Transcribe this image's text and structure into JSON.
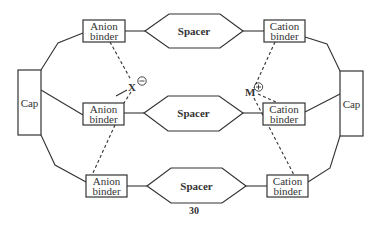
{
  "figure": {
    "number": "30",
    "caps": [
      {
        "id": "left",
        "label": "Cap"
      },
      {
        "id": "right",
        "label": "Cap"
      }
    ],
    "anion_binders": [
      {
        "line1": "Anion",
        "line2": "binder"
      },
      {
        "line1": "Anion",
        "line2": "binder"
      },
      {
        "line1": "Anion",
        "line2": "binder"
      }
    ],
    "cation_binders": [
      {
        "line1": "Cation",
        "line2": "binder"
      },
      {
        "line1": "Cation",
        "line2": "binder"
      },
      {
        "line1": "Cation",
        "line2": "binder"
      }
    ],
    "spacers": [
      {
        "label": "Spacer"
      },
      {
        "label": "Spacer"
      },
      {
        "label": "Spacer"
      }
    ],
    "anion": {
      "symbol": "X",
      "charge": "−"
    },
    "cation": {
      "symbol": "M",
      "charge": "+"
    }
  }
}
